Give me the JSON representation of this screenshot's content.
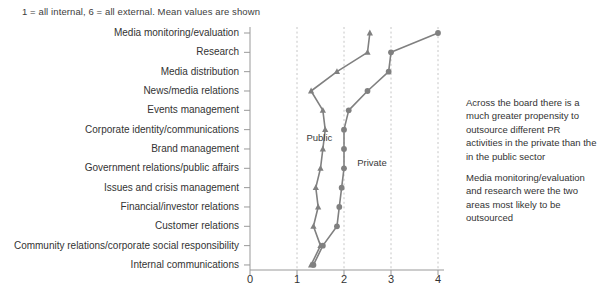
{
  "chart_data": {
    "type": "line",
    "orientation": "horizontal",
    "title": "",
    "subtitle": "1 = all internal, 6 = all external. Mean values are shown",
    "xlabel": "",
    "ylabel": "",
    "xlim": [
      0,
      4.4
    ],
    "xticks": [
      0,
      1,
      2,
      3,
      4
    ],
    "xtick_labels": [
      "0",
      "1",
      "2",
      "3",
      "4"
    ],
    "grid": "vertical-dashed",
    "legend_position": "inline-annotation",
    "categories": [
      "Media monitoring/evaluation",
      "Research",
      "Media distribution",
      "News/media relations",
      "Events management",
      "Corporate identity/communications",
      "Brand management",
      "Government relations/public affairs",
      "Issues and crisis management",
      "Financial/investor relations",
      "Customer relations",
      "Community relations/corporate social responsibility",
      "Internal communications"
    ],
    "series": [
      {
        "name": "Private",
        "marker": "circle",
        "color": "#808080",
        "values": [
          4.0,
          3.0,
          2.95,
          2.5,
          2.1,
          2.0,
          2.0,
          2.0,
          1.95,
          1.9,
          1.85,
          1.55,
          1.35
        ]
      },
      {
        "name": "Public",
        "marker": "triangle",
        "color": "#808080",
        "values": [
          2.55,
          2.5,
          1.85,
          1.3,
          1.55,
          1.6,
          1.55,
          1.5,
          1.4,
          1.45,
          1.35,
          1.5,
          1.3
        ]
      }
    ],
    "annotations": [
      {
        "text": "Public",
        "x": 1.2,
        "y_index": 5.45
      },
      {
        "text": "Private",
        "x": 2.28,
        "y_index": 6.75
      }
    ]
  },
  "notes": {
    "paragraph_1": "Across the board there is a much greater propensity to outsource different PR activities in the private than the in the public sector",
    "paragraph_2": "Media monitoring/evaluation and research were the two areas most likely to be outsourced"
  },
  "colors": {
    "series": "#808080",
    "axis": "#999999",
    "grid": "#bfbfbf",
    "text": "#333333"
  }
}
